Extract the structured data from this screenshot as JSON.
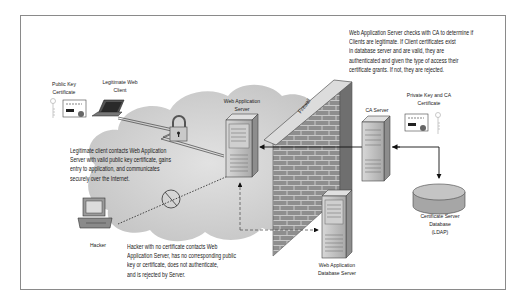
{
  "diagram": {
    "type": "network-security-architecture",
    "nodes": {
      "public_key_certificate": {
        "label_lines": [
          "Public Key",
          "Certificate"
        ]
      },
      "legitimate_web_client": {
        "label_lines": [
          "Legitimate Web",
          "Client"
        ]
      },
      "web_application_server": {
        "label_lines": [
          "Web Application",
          "Server"
        ]
      },
      "firewall": {
        "label": "Firewall"
      },
      "ca_server": {
        "label": "CA Server"
      },
      "private_key_ca_certificate": {
        "label_lines": [
          "Private Key and CA",
          "Certificate"
        ]
      },
      "certificate_server_database": {
        "label_lines": [
          "Certificate Server",
          "Database",
          "(LDAP)"
        ]
      },
      "web_application_database_server": {
        "label_lines": [
          "Web Application",
          "Database Server"
        ]
      },
      "hacker": {
        "label": "Hacker"
      }
    },
    "notes": {
      "ca_check": [
        "Web Application Server checks with CA to determine if",
        "Clients are legitimate.  If Client certificates  exist",
        "in database server and are valid, they are",
        "authenticated and given the type of access their",
        "certificate grants.  If not, they are rejected."
      ],
      "legit_client": [
        "Legitimate client contacts Web Application",
        "Server with valid public key certificate, gains",
        "entry to application, and communicates",
        "securely over the Internet."
      ],
      "hacker": [
        "Hacker with no certificate contacts Web",
        "Application Server, has no corresponding public",
        "key or certificate, does not authenticate,",
        "and is rejected by Server."
      ]
    },
    "edges": [
      {
        "from": "legitimate_web_client",
        "to": "web_application_server",
        "style": "double-line via lock"
      },
      {
        "from": "ca_server",
        "to": "web_application_server",
        "style": "solid arrow through firewall"
      },
      {
        "from": "certificate_server_database",
        "to": "ca_server",
        "style": "solid arrow"
      },
      {
        "from": "ca_server",
        "to": "certificate_server_database",
        "style": "solid arrow"
      },
      {
        "from": "hacker",
        "to": "web_application_server",
        "style": "dotted, blocked (no symbol)"
      },
      {
        "from": "web_application_database_server",
        "to": "web_application_server",
        "style": "dashed arrow"
      },
      {
        "from": "web_application_server",
        "to": "web_application_database_server",
        "style": "dashed arrow"
      }
    ],
    "colors": {
      "frame": "#8a8a8a",
      "cloud": "#cfcfcf",
      "server": "#b8b8b8",
      "brick": "#8f8f8f",
      "text": "#1a1a1a"
    }
  }
}
